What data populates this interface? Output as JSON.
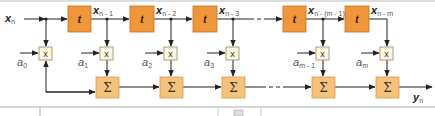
{
  "diagram": {
    "type": "FIR filter (tapped delay line) block diagram",
    "colors": {
      "delay_block": "#F0963A",
      "delay_block_border": "#C87020",
      "sum_block": "#F7C27A",
      "sum_block_border": "#D99A48",
      "multiplier_block": "#FBF6DC",
      "multiplier_border": "#8E8A6A",
      "line": "#222222",
      "label_gray": "#555555"
    },
    "input": {
      "symbol": "x",
      "subscript": "n"
    },
    "output": {
      "symbol": "y",
      "subscript": "n"
    },
    "delay_label": "t",
    "multiplier_label": "x",
    "sum_label": "Σ",
    "taps": [
      {
        "signal_symbol": "x",
        "signal_sub": "n - 1",
        "coef_symbol": "a",
        "coef_sub": "1"
      },
      {
        "signal_symbol": "x",
        "signal_sub": "n - 2",
        "coef_symbol": "a",
        "coef_sub": "2"
      },
      {
        "signal_symbol": "x",
        "signal_sub": "n - 3",
        "coef_symbol": "a",
        "coef_sub": "3"
      },
      {
        "signal_symbol": "x",
        "signal_sub": "n - (m - 1)",
        "coef_symbol": "a",
        "coef_sub": "m - 1"
      },
      {
        "signal_symbol": "x",
        "signal_sub": "n - m",
        "coef_symbol": "a",
        "coef_sub": "m"
      }
    ],
    "tap0": {
      "coef_symbol": "a",
      "coef_sub": "0"
    }
  }
}
